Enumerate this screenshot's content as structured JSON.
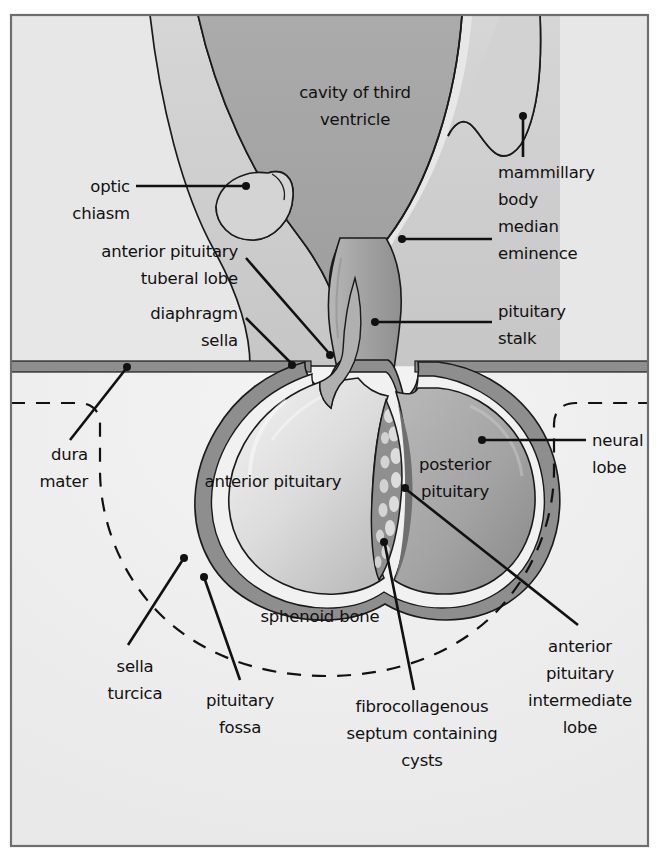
{
  "figure": {
    "border_color": "#6e6e6e",
    "background_color": "#ffffff"
  },
  "palette": {
    "page_background": "#ffffff",
    "cranial_background": "#e6e6e6",
    "sphenoid_background": "#efefef",
    "third_ventricle": "#a9a9a9",
    "brain_tissue": "#d2d2d2",
    "hypothalamus_shadow": "#c2c2c2",
    "pituitary_stalk": "#9e9e9e",
    "anterior_pituitary": "#d9d9d9",
    "posterior_pituitary": "#a3a3a3",
    "dura_mater": "#8c8c8c",
    "intermediate_lobe": "#8a8a8a",
    "septum_fill": "#9a9a9a",
    "cyst_fill": "#d6d6d6",
    "capsule_light": "#f2f2f2",
    "outline": "#1a1a1a",
    "label_text": "#111111",
    "leader_line": "#111111"
  },
  "labels": {
    "cavity_of_third_ventricle": {
      "id": "cavity-of-third-ventricle",
      "lines": [
        "cavity of third",
        "ventricle"
      ],
      "align": "middle",
      "x": 355,
      "y": 98,
      "line_height": 27,
      "has_leader": false
    },
    "mammillary_body": {
      "id": "mammillary-body",
      "lines": [
        "mammillary",
        "body"
      ],
      "align": "start",
      "x": 498,
      "y": 178,
      "line_height": 27,
      "has_leader": true,
      "leader_kind": "vertical-with-dot"
    },
    "median_eminence": {
      "id": "median-eminence",
      "lines": [
        "median",
        "eminence"
      ],
      "align": "start",
      "x": 498,
      "y": 232,
      "line_height": 27,
      "has_leader": true,
      "leader_kind": "horizontal-left-dot"
    },
    "optic_chiasm": {
      "id": "optic-chiasm",
      "lines": [
        "optic",
        "chiasm"
      ],
      "align": "end",
      "x": 130,
      "y": 190,
      "line_height": 27,
      "has_leader": true,
      "leader_kind": "horizontal-right-dot"
    },
    "anterior_pituitary_tuberal_lobe": {
      "id": "anterior-pituitary-tuberal-lobe",
      "lines": [
        "anterior pituitary",
        "tuberal lobe"
      ],
      "align": "end",
      "x": 238,
      "y": 255,
      "line_height": 27,
      "has_leader": true,
      "leader_kind": "diagonal-dot"
    },
    "diaphragm_sella": {
      "id": "diaphragm-sella",
      "lines": [
        "diaphragm",
        "sella"
      ],
      "align": "end",
      "x": 238,
      "y": 315,
      "line_height": 27,
      "has_leader": true,
      "leader_kind": "diagonal-dot"
    },
    "pituitary_stalk": {
      "id": "pituitary-stalk",
      "lines": [
        "pituitary",
        "stalk"
      ],
      "align": "start",
      "x": 498,
      "y": 317,
      "line_height": 27,
      "has_leader": true,
      "leader_kind": "horizontal-left-dot"
    },
    "dura_mater": {
      "id": "dura-mater",
      "lines": [
        "dura",
        "mater"
      ],
      "align": "end",
      "x": 88,
      "y": 455,
      "line_height": 27,
      "has_leader": true,
      "leader_kind": "diagonal-dot"
    },
    "neural_lobe": {
      "id": "neural-lobe",
      "lines": [
        "neural",
        "lobe"
      ],
      "align": "start",
      "x": 592,
      "y": 445,
      "line_height": 27,
      "has_leader": true,
      "leader_kind": "horizontal-left-dot"
    },
    "anterior_pituitary": {
      "id": "anterior-pituitary",
      "lines": [
        "anterior pituitary"
      ],
      "align": "middle",
      "x": 273,
      "y": 487,
      "line_height": 27,
      "has_leader": false
    },
    "posterior_pituitary": {
      "id": "posterior-pituitary",
      "lines": [
        "posterior",
        "pituitary"
      ],
      "align": "middle",
      "x": 455,
      "y": 470,
      "line_height": 27,
      "has_leader": false
    },
    "sphenoid_bone": {
      "id": "sphenoid-bone",
      "lines": [
        "sphenoid bone"
      ],
      "align": "middle",
      "x": 320,
      "y": 622,
      "line_height": 27,
      "has_leader": false
    },
    "sella_turcica": {
      "id": "sella-turcica",
      "lines": [
        "sella",
        "turcica"
      ],
      "align": "middle",
      "x": 135,
      "y": 670,
      "line_height": 27,
      "has_leader": true,
      "leader_kind": "diagonal-dot"
    },
    "pituitary_fossa": {
      "id": "pituitary-fossa",
      "lines": [
        "pituitary",
        "fossa"
      ],
      "align": "middle",
      "x": 240,
      "y": 706,
      "line_height": 27,
      "has_leader": true,
      "leader_kind": "vertical-dot"
    },
    "fibrocollagenous_septum": {
      "id": "fibrocollagenous-septum-containing-cysts",
      "lines": [
        "fibrocollagenous",
        "septum containing",
        "cysts"
      ],
      "align": "middle",
      "x": 422,
      "y": 712,
      "line_height": 27,
      "has_leader": true,
      "leader_kind": "diagonal-dot"
    },
    "anterior_pituitary_intermediate_lobe": {
      "id": "anterior-pituitary-intermediate-lobe",
      "lines": [
        "anterior",
        "pituitary",
        "intermediate",
        "lobe"
      ],
      "align": "middle",
      "x": 580,
      "y": 650,
      "line_height": 27,
      "has_leader": true,
      "leader_kind": "diagonal-dot"
    }
  },
  "regions": [
    {
      "id": "cranial-cavity",
      "name": "cranial-cavity-background"
    },
    {
      "id": "third-ventricle",
      "name": "third-ventricle-cavity"
    },
    {
      "id": "hypothalamus",
      "name": "hypothalamus-tissue"
    },
    {
      "id": "optic-chiasm-shape",
      "name": "optic-chiasm"
    },
    {
      "id": "mammillary-shape",
      "name": "mammillary-body"
    },
    {
      "id": "stalk",
      "name": "pituitary-stalk"
    },
    {
      "id": "dura-band",
      "name": "diaphragma-sellae"
    },
    {
      "id": "anterior-lobe",
      "name": "anterior-pituitary-lobe"
    },
    {
      "id": "posterior-lobe",
      "name": "posterior-pituitary-lobe"
    },
    {
      "id": "septum",
      "name": "fibrocollagenous-septum"
    },
    {
      "id": "sella-dashes",
      "name": "sella-turcica-dashed-outline"
    },
    {
      "id": "sphenoid",
      "name": "sphenoid-bone-region"
    }
  ]
}
